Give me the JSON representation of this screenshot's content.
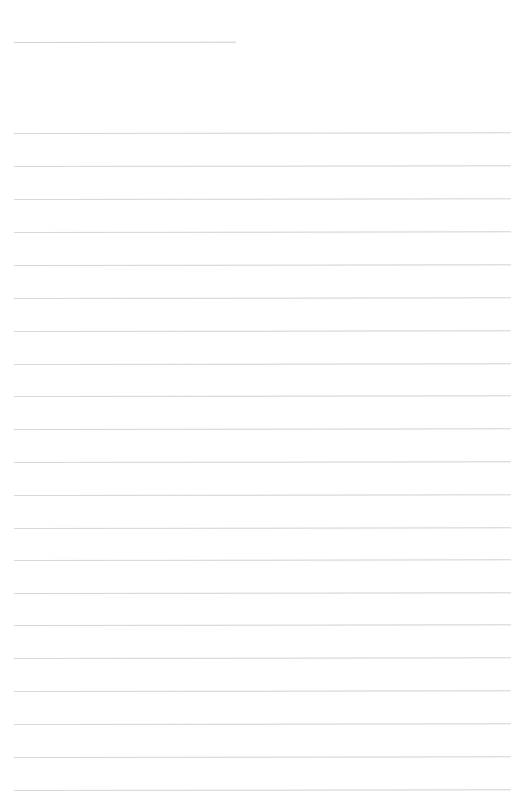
{
  "page": {
    "kind": "lined-paper",
    "width": 525,
    "height": 811,
    "background_color": "#ffffff",
    "rule_color": "#c9c9ce",
    "rule_thickness_px": 1,
    "rule_left_px": 14,
    "rule_right_px": 511,
    "rule_spacing_px": 33,
    "skew_degrees": -0.085,
    "text_content": "",
    "visible_text_lines": []
  },
  "title_rule": {
    "name": "title-rule",
    "y": 42,
    "left": 14,
    "right": 236,
    "width": 222,
    "color": "#c4c4c9",
    "value": ""
  },
  "body_rules": [
    {
      "index": 1,
      "y": 133,
      "left": 14,
      "right": 511,
      "value": ""
    },
    {
      "index": 2,
      "y": 166,
      "left": 14,
      "right": 511,
      "value": ""
    },
    {
      "index": 3,
      "y": 199,
      "left": 14,
      "right": 511,
      "value": ""
    },
    {
      "index": 4,
      "y": 232,
      "left": 14,
      "right": 511,
      "value": ""
    },
    {
      "index": 5,
      "y": 265,
      "left": 14,
      "right": 511,
      "value": ""
    },
    {
      "index": 6,
      "y": 298,
      "left": 14,
      "right": 511,
      "value": ""
    },
    {
      "index": 7,
      "y": 331,
      "left": 14,
      "right": 511,
      "value": ""
    },
    {
      "index": 8,
      "y": 364,
      "left": 14,
      "right": 511,
      "value": ""
    },
    {
      "index": 9,
      "y": 396,
      "left": 14,
      "right": 511,
      "value": ""
    },
    {
      "index": 10,
      "y": 429,
      "left": 14,
      "right": 511,
      "value": ""
    },
    {
      "index": 11,
      "y": 462,
      "left": 14,
      "right": 511,
      "value": ""
    },
    {
      "index": 12,
      "y": 495,
      "left": 14,
      "right": 511,
      "value": ""
    },
    {
      "index": 13,
      "y": 528,
      "left": 14,
      "right": 511,
      "value": ""
    },
    {
      "index": 14,
      "y": 560,
      "left": 14,
      "right": 511,
      "value": ""
    },
    {
      "index": 15,
      "y": 593,
      "left": 14,
      "right": 511,
      "value": ""
    },
    {
      "index": 16,
      "y": 625,
      "left": 14,
      "right": 511,
      "value": ""
    },
    {
      "index": 17,
      "y": 658,
      "left": 14,
      "right": 511,
      "value": ""
    },
    {
      "index": 18,
      "y": 691,
      "left": 14,
      "right": 511,
      "value": ""
    },
    {
      "index": 19,
      "y": 724,
      "left": 14,
      "right": 511,
      "value": ""
    },
    {
      "index": 20,
      "y": 757,
      "left": 14,
      "right": 511,
      "value": ""
    },
    {
      "index": 21,
      "y": 790,
      "left": 14,
      "right": 511,
      "value": ""
    }
  ]
}
